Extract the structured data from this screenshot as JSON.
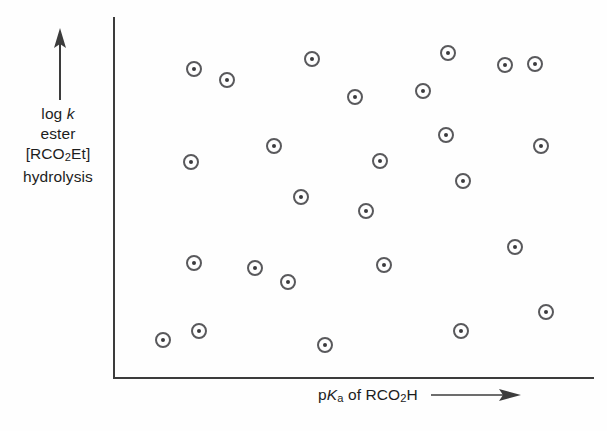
{
  "figure": {
    "background_color": "#fefefe",
    "axis_color": "#3c3c3c",
    "marker_stroke_color": "#59595c",
    "marker_dot_color": "#3a3a3d"
  },
  "axes": {
    "y": {
      "label_lines": [
        "log k",
        "ester",
        "[RCO2Et]",
        "hydrolysis"
      ],
      "label_line1_prefix": "log ",
      "label_line1_italic": "k",
      "label_line2": "ester",
      "label_line3_prefix": "[RCO",
      "label_line3_sub": "2",
      "label_line3_suffix": "Et]",
      "label_line4": "hydrolysis",
      "arrow_direction": "up",
      "has_ticks": false,
      "has_tick_labels": false
    },
    "x": {
      "label_prefix": "p",
      "label_italic": "K",
      "label_sub": "a",
      "label_suffix": " of RCO",
      "label_sub2": "2",
      "label_suffix2": "H",
      "label_plain": "pKa of RCO2H",
      "arrow_direction": "right",
      "has_ticks": false,
      "has_tick_labels": false
    }
  },
  "chart_data": {
    "type": "scatter",
    "title": "",
    "subtitle": "",
    "xlabel": "pKa of RCO2H",
    "ylabel": "log k ester [RCO2Et] hydrolysis",
    "xlim": [
      0,
      1
    ],
    "ylim": [
      0,
      1
    ],
    "grid": false,
    "legend": null,
    "n_points": 26,
    "marker": "circle-with-center-dot",
    "note": "Uncorrelated random scatter; no trend line. Axis units unlabeled (schematic figure). Values below are normalized 0-1 positions read off the plot frame, x increasing right, y increasing up.",
    "points": [
      {
        "x": 0.167,
        "y": 0.858
      },
      {
        "x": 0.236,
        "y": 0.828
      },
      {
        "x": 0.413,
        "y": 0.886
      },
      {
        "x": 0.697,
        "y": 0.903
      },
      {
        "x": 0.816,
        "y": 0.869
      },
      {
        "x": 0.879,
        "y": 0.872
      },
      {
        "x": 0.504,
        "y": 0.794
      },
      {
        "x": 0.645,
        "y": 0.811
      },
      {
        "x": 0.334,
        "y": 0.642
      },
      {
        "x": 0.163,
        "y": 0.597
      },
      {
        "x": 0.694,
        "y": 0.673
      },
      {
        "x": 0.891,
        "y": 0.642
      },
      {
        "x": 0.555,
        "y": 0.6
      },
      {
        "x": 0.728,
        "y": 0.544
      },
      {
        "x": 0.39,
        "y": 0.5
      },
      {
        "x": 0.526,
        "y": 0.461
      },
      {
        "x": 0.836,
        "y": 0.361
      },
      {
        "x": 0.167,
        "y": 0.317
      },
      {
        "x": 0.296,
        "y": 0.303
      },
      {
        "x": 0.364,
        "y": 0.264
      },
      {
        "x": 0.563,
        "y": 0.311
      },
      {
        "x": 0.901,
        "y": 0.181
      },
      {
        "x": 0.178,
        "y": 0.128
      },
      {
        "x": 0.103,
        "y": 0.103
      },
      {
        "x": 0.441,
        "y": 0.089
      },
      {
        "x": 0.725,
        "y": 0.128
      }
    ],
    "pixel_points": [
      {
        "cx": 194,
        "cy": 69
      },
      {
        "cx": 227,
        "cy": 80
      },
      {
        "cx": 312,
        "cy": 59
      },
      {
        "cx": 448,
        "cy": 53
      },
      {
        "cx": 505,
        "cy": 65
      },
      {
        "cx": 535,
        "cy": 64
      },
      {
        "cx": 355,
        "cy": 97
      },
      {
        "cx": 423,
        "cy": 91
      },
      {
        "cx": 274,
        "cy": 146
      },
      {
        "cx": 191,
        "cy": 162
      },
      {
        "cx": 446,
        "cy": 135
      },
      {
        "cx": 541,
        "cy": 146
      },
      {
        "cx": 380,
        "cy": 161
      },
      {
        "cx": 463,
        "cy": 181
      },
      {
        "cx": 301,
        "cy": 197
      },
      {
        "cx": 366,
        "cy": 211
      },
      {
        "cx": 515,
        "cy": 247
      },
      {
        "cx": 194,
        "cy": 263
      },
      {
        "cx": 255,
        "cy": 268
      },
      {
        "cx": 288,
        "cy": 282
      },
      {
        "cx": 384,
        "cy": 265
      },
      {
        "cx": 546,
        "cy": 312
      },
      {
        "cx": 199,
        "cy": 331
      },
      {
        "cx": 163,
        "cy": 340
      },
      {
        "cx": 325,
        "cy": 345
      },
      {
        "cx": 461,
        "cy": 331
      }
    ]
  }
}
